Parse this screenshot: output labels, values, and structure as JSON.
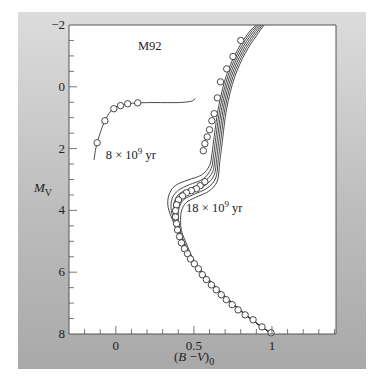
{
  "chart_data": {
    "type": "scatter",
    "title": "M92",
    "xlabel": "(B−V)₀",
    "xlabel_parts": {
      "open": "(",
      "B": "B",
      "minus": " −",
      "V": "V",
      "close": ")",
      "sub": "0"
    },
    "ylabel": "M_V",
    "ylabel_parts": {
      "main": "M",
      "sub": "V"
    },
    "xlim": [
      -0.3,
      1.41
    ],
    "ylim": [
      8,
      -2
    ],
    "y_inverted": true,
    "x_ticks": [
      {
        "value": 0,
        "label": "0"
      },
      {
        "value": 0.5,
        "label": "0.5"
      },
      {
        "value": 1,
        "label": "1"
      }
    ],
    "x_minor_step": 0.1,
    "y_ticks": [
      {
        "value": -2,
        "label": "−2"
      },
      {
        "value": 0,
        "label": "0"
      },
      {
        "value": 2,
        "label": "2"
      },
      {
        "value": 4,
        "label": "4"
      },
      {
        "value": 6,
        "label": "6"
      },
      {
        "value": 8,
        "label": "8"
      }
    ],
    "y_minor_step": 0.5,
    "grid": false,
    "annotations": [
      {
        "text": "8 × 10",
        "sup": "9",
        "unit": " yr",
        "x": 0.32,
        "y": 2.35
      },
      {
        "text": "18 × 10",
        "sup": "9",
        "unit": " yr",
        "x": 0.45,
        "y": 4.05
      }
    ],
    "observed_points": {
      "name": "M92 observed",
      "marker": "open-circle",
      "horizontal_branch": [
        [
          -0.12,
          1.81
        ],
        [
          -0.07,
          1.1
        ],
        [
          -0.013,
          0.71
        ],
        [
          0.03,
          0.61
        ],
        [
          0.076,
          0.55
        ],
        [
          0.14,
          0.52
        ]
      ],
      "main_sequence_and_giant_branch": [
        [
          0.8,
          -1.5
        ],
        [
          0.75,
          -0.98
        ],
        [
          0.71,
          -0.58
        ],
        [
          0.67,
          -0.16
        ],
        [
          0.65,
          0.36
        ],
        [
          0.63,
          0.87
        ],
        [
          0.615,
          1.1
        ],
        [
          0.6,
          1.39
        ],
        [
          0.585,
          1.62
        ],
        [
          0.57,
          1.84
        ],
        [
          0.56,
          2.07
        ],
        [
          0.57,
          3.07
        ],
        [
          0.54,
          3.2
        ],
        [
          0.516,
          3.3
        ],
        [
          0.484,
          3.36
        ],
        [
          0.452,
          3.43
        ],
        [
          0.427,
          3.53
        ],
        [
          0.401,
          3.66
        ],
        [
          0.389,
          3.82
        ],
        [
          0.382,
          4.01
        ],
        [
          0.382,
          4.21
        ],
        [
          0.389,
          4.43
        ],
        [
          0.395,
          4.63
        ],
        [
          0.408,
          4.85
        ],
        [
          0.42,
          5.05
        ],
        [
          0.439,
          5.24
        ],
        [
          0.459,
          5.4
        ],
        [
          0.478,
          5.57
        ],
        [
          0.503,
          5.73
        ],
        [
          0.529,
          5.89
        ],
        [
          0.554,
          6.08
        ],
        [
          0.58,
          6.24
        ],
        [
          0.612,
          6.41
        ],
        [
          0.643,
          6.57
        ],
        [
          0.675,
          6.73
        ],
        [
          0.707,
          6.89
        ],
        [
          0.745,
          7.05
        ],
        [
          0.783,
          7.22
        ],
        [
          0.828,
          7.38
        ],
        [
          0.879,
          7.54
        ],
        [
          0.936,
          7.77
        ],
        [
          0.994,
          7.96
        ]
      ]
    },
    "series": [
      {
        "name": "horizontal branch model",
        "points": [
          [
            -0.14,
            2.37
          ],
          [
            -0.12,
            1.81
          ],
          [
            -0.07,
            1.1
          ],
          [
            -0.02,
            0.72
          ],
          [
            0.03,
            0.61
          ],
          [
            0.08,
            0.55
          ],
          [
            0.14,
            0.52
          ],
          [
            0.25,
            0.51
          ],
          [
            0.4,
            0.51
          ],
          [
            0.48,
            0.47
          ],
          [
            0.51,
            0.38
          ]
        ]
      },
      {
        "name": "isochrone 8e9 yr",
        "age_gyr": 8,
        "points": [
          [
            1.0,
            8.0
          ],
          [
            0.83,
            7.38
          ],
          [
            0.65,
            6.57
          ],
          [
            0.5,
            5.73
          ],
          [
            0.42,
            5.05
          ],
          [
            0.37,
            4.4
          ],
          [
            0.335,
            3.9
          ],
          [
            0.34,
            3.5
          ],
          [
            0.38,
            3.2
          ],
          [
            0.46,
            3.02
          ],
          [
            0.55,
            2.85
          ],
          [
            0.6,
            2.55
          ],
          [
            0.615,
            2.2
          ],
          [
            0.63,
            1.6
          ],
          [
            0.66,
            0.6
          ],
          [
            0.71,
            -0.4
          ],
          [
            0.78,
            -1.2
          ],
          [
            0.85,
            -1.75
          ],
          [
            0.9,
            -2.0
          ]
        ]
      },
      {
        "name": "isochrone 10e9 yr",
        "age_gyr": 10,
        "points": [
          [
            1.0,
            8.0
          ],
          [
            0.83,
            7.38
          ],
          [
            0.65,
            6.57
          ],
          [
            0.5,
            5.73
          ],
          [
            0.425,
            5.05
          ],
          [
            0.38,
            4.45
          ],
          [
            0.355,
            4.0
          ],
          [
            0.36,
            3.62
          ],
          [
            0.4,
            3.35
          ],
          [
            0.47,
            3.17
          ],
          [
            0.56,
            2.98
          ],
          [
            0.61,
            2.65
          ],
          [
            0.625,
            2.25
          ],
          [
            0.64,
            1.65
          ],
          [
            0.67,
            0.62
          ],
          [
            0.72,
            -0.38
          ],
          [
            0.79,
            -1.18
          ],
          [
            0.86,
            -1.73
          ],
          [
            0.91,
            -2.0
          ]
        ]
      },
      {
        "name": "isochrone 12e9 yr",
        "age_gyr": 12,
        "points": [
          [
            1.0,
            8.0
          ],
          [
            0.83,
            7.38
          ],
          [
            0.65,
            6.57
          ],
          [
            0.5,
            5.73
          ],
          [
            0.43,
            5.05
          ],
          [
            0.39,
            4.5
          ],
          [
            0.37,
            4.1
          ],
          [
            0.375,
            3.72
          ],
          [
            0.41,
            3.45
          ],
          [
            0.48,
            3.28
          ],
          [
            0.565,
            3.08
          ],
          [
            0.62,
            2.75
          ],
          [
            0.635,
            2.3
          ],
          [
            0.65,
            1.7
          ],
          [
            0.68,
            0.64
          ],
          [
            0.73,
            -0.36
          ],
          [
            0.8,
            -1.16
          ],
          [
            0.87,
            -1.71
          ],
          [
            0.92,
            -2.0
          ]
        ]
      },
      {
        "name": "isochrone 14e9 yr",
        "age_gyr": 14,
        "points": [
          [
            1.0,
            8.0
          ],
          [
            0.83,
            7.38
          ],
          [
            0.65,
            6.57
          ],
          [
            0.505,
            5.73
          ],
          [
            0.435,
            5.05
          ],
          [
            0.4,
            4.55
          ],
          [
            0.385,
            4.18
          ],
          [
            0.39,
            3.82
          ],
          [
            0.42,
            3.55
          ],
          [
            0.49,
            3.38
          ],
          [
            0.575,
            3.18
          ],
          [
            0.63,
            2.85
          ],
          [
            0.645,
            2.35
          ],
          [
            0.66,
            1.75
          ],
          [
            0.69,
            0.66
          ],
          [
            0.74,
            -0.34
          ],
          [
            0.81,
            -1.14
          ],
          [
            0.88,
            -1.69
          ],
          [
            0.93,
            -2.0
          ]
        ]
      },
      {
        "name": "isochrone 16e9 yr",
        "age_gyr": 16,
        "points": [
          [
            1.0,
            8.0
          ],
          [
            0.83,
            7.38
          ],
          [
            0.655,
            6.57
          ],
          [
            0.51,
            5.73
          ],
          [
            0.44,
            5.05
          ],
          [
            0.41,
            4.6
          ],
          [
            0.4,
            4.25
          ],
          [
            0.405,
            3.92
          ],
          [
            0.435,
            3.65
          ],
          [
            0.5,
            3.48
          ],
          [
            0.585,
            3.28
          ],
          [
            0.64,
            2.95
          ],
          [
            0.655,
            2.4
          ],
          [
            0.67,
            1.8
          ],
          [
            0.7,
            0.68
          ],
          [
            0.75,
            -0.32
          ],
          [
            0.82,
            -1.12
          ],
          [
            0.89,
            -1.67
          ],
          [
            0.94,
            -2.0
          ]
        ]
      },
      {
        "name": "isochrone 18e9 yr",
        "age_gyr": 18,
        "points": [
          [
            1.0,
            8.0
          ],
          [
            0.835,
            7.38
          ],
          [
            0.66,
            6.57
          ],
          [
            0.515,
            5.73
          ],
          [
            0.45,
            5.05
          ],
          [
            0.42,
            4.65
          ],
          [
            0.415,
            4.32
          ],
          [
            0.42,
            4.02
          ],
          [
            0.45,
            3.75
          ],
          [
            0.51,
            3.58
          ],
          [
            0.595,
            3.38
          ],
          [
            0.65,
            3.05
          ],
          [
            0.665,
            2.45
          ],
          [
            0.68,
            1.85
          ],
          [
            0.71,
            0.7
          ],
          [
            0.76,
            -0.3
          ],
          [
            0.83,
            -1.1
          ],
          [
            0.9,
            -1.65
          ],
          [
            0.95,
            -2.0
          ]
        ]
      }
    ]
  },
  "colors": {
    "axis": "#555555",
    "curve": "#333333",
    "marker_fill": "#ffffff",
    "marker_stroke": "#333333",
    "plot_bg": "#ffffff"
  }
}
